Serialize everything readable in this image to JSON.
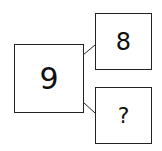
{
  "diagram": {
    "main_box": {
      "value": "9"
    },
    "top_box": {
      "value": "8"
    },
    "bottom_box": {
      "value": "?"
    },
    "line_color": "#222222"
  }
}
